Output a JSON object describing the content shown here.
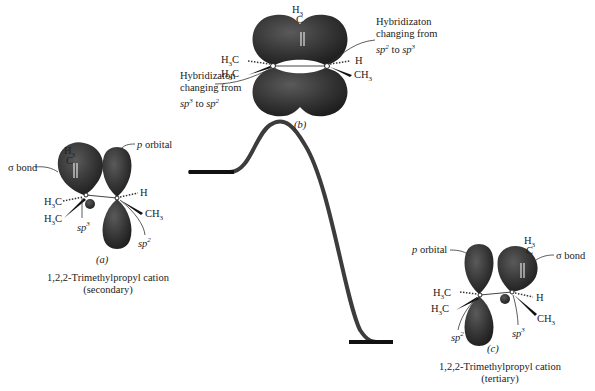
{
  "figure": {
    "panels": {
      "a": {
        "tag": "(a)",
        "name": "1,2,2-Trimethylpropyl cation",
        "type": "(secondary)",
        "labels": {
          "sigma_bond": "σ bond",
          "p_orbital": "p orbital",
          "H3_top": "H3",
          "C_top": "C",
          "H3C_1": "H3C",
          "H3C_2": "H3C",
          "H": "H",
          "CH3": "CH3",
          "sp3": "sp3",
          "sp2": "sp2"
        }
      },
      "b": {
        "tag": "(b)",
        "labels": {
          "H3_top": "H3",
          "C_top": "C",
          "H3C_1": "H3C",
          "H3C_2": "H3C",
          "H": "H",
          "CH3": "CH3",
          "hybrid_right_1": "Hybridizaton",
          "hybrid_right_2": "changing from",
          "hybrid_right_3_a": "sp2",
          "hybrid_right_3_b": " to ",
          "hybrid_right_3_c": "sp3",
          "hybrid_left_1": "Hybridizaton",
          "hybrid_left_2": "changing from",
          "hybrid_left_3_a": "sp3",
          "hybrid_left_3_b": " to ",
          "hybrid_left_3_c": "sp2"
        }
      },
      "c": {
        "tag": "(c)",
        "name": "1,2,2-Trimethylpropyl cation",
        "type": "(tertiary)",
        "labels": {
          "p_orbital": "p orbital",
          "sigma_bond": "σ bond",
          "H3_top": "H3",
          "C_top": "C",
          "H3C_1": "H3C",
          "H3C_2": "H3C",
          "H": "H",
          "CH3": "CH3",
          "sp2": "sp2",
          "sp3": "sp3"
        }
      }
    },
    "energy_profile": {
      "start_level": "secondary cation",
      "peak": "transition state (b)",
      "end_level": "tertiary cation"
    },
    "colors": {
      "orbital": "#3a3a3a",
      "curve": "#3c3c3c",
      "text": "#222222"
    }
  }
}
